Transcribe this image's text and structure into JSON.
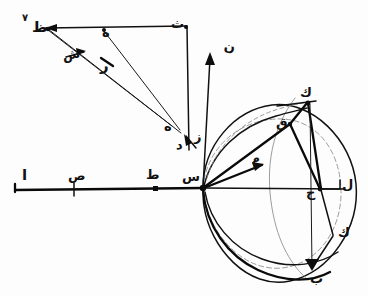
{
  "figure": {
    "folio_mark": "٧",
    "ink_color": "#111111",
    "faint_ink_color": "#8a8a8a",
    "background_color": "#ffffff"
  },
  "labels": {
    "upper_triangle": [
      {
        "id": "lbl-zh",
        "text": "ظ",
        "x": 32,
        "y": 26,
        "size": "lg",
        "rot": "none"
      },
      {
        "id": "lbl-h1",
        "text": "ه",
        "x": 100,
        "y": 33,
        "size": "md",
        "rot": "none"
      },
      {
        "id": "lbl-sh",
        "text": "ش",
        "x": 68,
        "y": 53,
        "size": "md",
        "rot": "a"
      },
      {
        "id": "lbl-r",
        "text": "ر",
        "x": 100,
        "y": 60,
        "size": "lg",
        "rot": "none"
      },
      {
        "id": "lbl-th",
        "text": "ث",
        "x": 168,
        "y": 22,
        "size": "md",
        "rot": "none"
      },
      {
        "id": "lbl-h2",
        "text": "ه",
        "x": 160,
        "y": 122,
        "size": "md",
        "rot": "none"
      },
      {
        "id": "lbl-d",
        "text": "د",
        "x": 178,
        "y": 140,
        "size": "md",
        "rot": "none"
      },
      {
        "id": "lbl-z",
        "text": "ز",
        "x": 193,
        "y": 131,
        "size": "md",
        "rot": "none"
      }
    ],
    "baseline": [
      {
        "id": "lbl-alif",
        "text": "ا",
        "x": 20,
        "y": 172,
        "size": "lg",
        "rot": "none"
      },
      {
        "id": "lbl-sad",
        "text": "ص",
        "x": 70,
        "y": 172,
        "size": "md",
        "rot": "none"
      },
      {
        "id": "lbl-ta",
        "text": "ط",
        "x": 145,
        "y": 170,
        "size": "md",
        "rot": "none"
      },
      {
        "id": "lbl-seen",
        "text": "س",
        "x": 183,
        "y": 173,
        "size": "md",
        "rot": "none"
      }
    ],
    "vertical_axis": [
      {
        "id": "lbl-noon",
        "text": "ن",
        "x": 224,
        "y": 43,
        "size": "md",
        "rot": "none"
      }
    ],
    "circle": [
      {
        "id": "lbl-kaf",
        "text": "ك",
        "x": 300,
        "y": 90,
        "size": "md",
        "rot": "none"
      },
      {
        "id": "lbl-qaf",
        "text": "ق",
        "x": 278,
        "y": 122,
        "size": "md",
        "rot": "none"
      },
      {
        "id": "lbl-meem",
        "text": "م",
        "x": 252,
        "y": 158,
        "size": "md",
        "rot": "c"
      },
      {
        "id": "lbl-ha",
        "text": "ح",
        "x": 309,
        "y": 192,
        "size": "md",
        "rot": "none"
      },
      {
        "id": "lbl-lam",
        "text": "ل",
        "x": 342,
        "y": 183,
        "size": "md",
        "rot": "none"
      },
      {
        "id": "lbl-kaf2",
        "text": "ك",
        "x": 337,
        "y": 231,
        "size": "md",
        "rot": "none"
      },
      {
        "id": "lbl-ba",
        "text": "ب",
        "x": 313,
        "y": 273,
        "size": "md",
        "rot": "none"
      }
    ]
  },
  "geometry": {
    "origin_point": {
      "x": 203,
      "y": 188
    },
    "baseline": {
      "x1": 14,
      "y1": 189,
      "x2": 345,
      "y2": 189
    },
    "vertical_axis": {
      "x1": 203,
      "y1": 188,
      "x2": 211,
      "y2": 52
    },
    "top_horizontal": {
      "x1": 44,
      "y1": 28,
      "x2": 186,
      "y2": 26
    },
    "circle": {
      "cx": 272,
      "cy": 188,
      "r": 85
    },
    "tick_marks": [
      {
        "x": 74,
        "y": 189
      },
      {
        "x": 155,
        "y": 189
      }
    ]
  }
}
